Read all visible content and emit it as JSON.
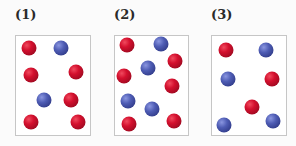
{
  "colors": {
    "red": "#d4102e",
    "blue": "#4e5cb4",
    "border": "#c6c6c6"
  },
  "panels": [
    {
      "label": "(1)",
      "label_x": 15,
      "box": {
        "left": 15,
        "width": 76
      },
      "balls": [
        {
          "color": "red",
          "x": 29,
          "y": 48
        },
        {
          "color": "blue",
          "x": 61,
          "y": 48
        },
        {
          "color": "red",
          "x": 31,
          "y": 75
        },
        {
          "color": "red",
          "x": 76,
          "y": 72
        },
        {
          "color": "blue",
          "x": 44,
          "y": 100
        },
        {
          "color": "red",
          "x": 71,
          "y": 100
        },
        {
          "color": "red",
          "x": 31,
          "y": 122
        },
        {
          "color": "red",
          "x": 78,
          "y": 122
        }
      ]
    },
    {
      "label": "(2)",
      "label_x": 114,
      "box": {
        "left": 114,
        "width": 75
      },
      "balls": [
        {
          "color": "red",
          "x": 127,
          "y": 45
        },
        {
          "color": "blue",
          "x": 161,
          "y": 44
        },
        {
          "color": "red",
          "x": 175,
          "y": 61
        },
        {
          "color": "blue",
          "x": 148,
          "y": 68
        },
        {
          "color": "red",
          "x": 124,
          "y": 76
        },
        {
          "color": "red",
          "x": 172,
          "y": 86
        },
        {
          "color": "blue",
          "x": 128,
          "y": 101
        },
        {
          "color": "blue",
          "x": 152,
          "y": 109
        },
        {
          "color": "red",
          "x": 129,
          "y": 124
        },
        {
          "color": "red",
          "x": 174,
          "y": 121
        }
      ]
    },
    {
      "label": "(3)",
      "label_x": 211,
      "box": {
        "left": 211,
        "width": 76
      },
      "balls": [
        {
          "color": "red",
          "x": 226,
          "y": 50
        },
        {
          "color": "blue",
          "x": 266,
          "y": 50
        },
        {
          "color": "blue",
          "x": 228,
          "y": 79
        },
        {
          "color": "red",
          "x": 272,
          "y": 79
        },
        {
          "color": "red",
          "x": 252,
          "y": 107
        },
        {
          "color": "blue",
          "x": 224,
          "y": 125
        },
        {
          "color": "blue",
          "x": 273,
          "y": 121
        }
      ]
    }
  ]
}
